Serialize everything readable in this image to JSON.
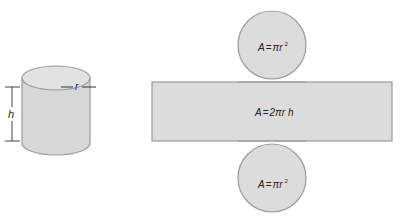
{
  "diagram": {
    "cylinder": {
      "radius_label": "r",
      "height_label": "h"
    },
    "net": {
      "top_circle": {
        "formula": "A = πr²",
        "A": "A",
        "eq": "=",
        "pi": "π",
        "r": "r",
        "exp": "2"
      },
      "rectangle": {
        "formula": "A = 2πrh",
        "A": "A",
        "eq": "=",
        "body": "2πr h"
      },
      "bottom_circle": {
        "formula": "A = πr²",
        "A": "A",
        "eq": "=",
        "pi": "π",
        "r": "r",
        "exp": "2"
      }
    },
    "colors": {
      "fill": "#dcdcdc",
      "stroke": "#9a9a9a",
      "text": "#222222"
    }
  }
}
